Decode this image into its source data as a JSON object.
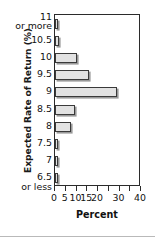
{
  "chart_data": {
    "type": "bar",
    "orientation": "horizontal",
    "title": "",
    "xlabel": "Percent",
    "ylabel": "Expected Rate of Return (%)",
    "categories": [
      "11 or more",
      "10.5",
      "10",
      "9.5",
      "9",
      "8.5",
      "8",
      "7.5",
      "7",
      "6.5 or less"
    ],
    "category_labels": [
      {
        "main": "11",
        "sub": "or more"
      },
      {
        "main": "10.5",
        "sub": ""
      },
      {
        "main": "10",
        "sub": ""
      },
      {
        "main": "9.5",
        "sub": ""
      },
      {
        "main": "9",
        "sub": ""
      },
      {
        "main": "8.5",
        "sub": ""
      },
      {
        "main": "8",
        "sub": ""
      },
      {
        "main": "7.5",
        "sub": ""
      },
      {
        "main": "7",
        "sub": ""
      },
      {
        "main": "6.5",
        "sub": "or less"
      }
    ],
    "values": [
      1,
      2,
      10,
      16,
      29,
      9.5,
      7.5,
      1.5,
      0.8,
      0.8
    ],
    "xlim": [
      0,
      40
    ],
    "xticks": [
      0,
      5,
      10,
      15,
      20,
      25,
      30,
      35,
      40
    ],
    "xticklabels": [
      "0",
      "5",
      "10",
      "15",
      "20",
      "",
      "30",
      "",
      "40"
    ],
    "grid": false,
    "legend": null,
    "bar_fill_color": "#e2e2e2",
    "bar_edge_color": "#3a3a3a",
    "frame_color": "#2b2b2b"
  }
}
